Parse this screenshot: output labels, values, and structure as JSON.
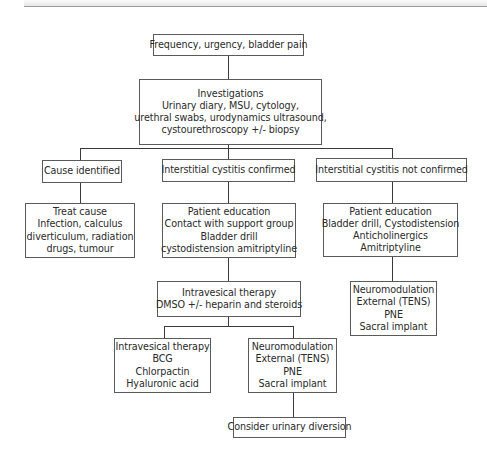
{
  "nodes": {
    "symptoms": {
      "lines": [
        "Frequency, urgency, bladder pain"
      ]
    },
    "investigations": {
      "lines": [
        "Investigations",
        "Urinary diary, MSU, cytology,",
        "urethral swabs, urodynamics ultrasound,",
        "cystourethroscopy +/- biopsy"
      ]
    },
    "cause_identified": {
      "lines": [
        "Cause identified"
      ]
    },
    "ic_confirmed": {
      "lines": [
        "Interstitial cystitis confirmed"
      ]
    },
    "ic_not_confirmed": {
      "lines": [
        "Interstitial cystitis not confirmed"
      ]
    },
    "treat_cause": {
      "lines": [
        "Treat cause",
        "Infection, calculus",
        "diverticulum, radiation",
        "drugs, tumour"
      ]
    },
    "patient_education_confirmed": {
      "lines": [
        "Patient education",
        "Contact with support group",
        "Bladder drill",
        "cystodistension amitriptyline"
      ]
    },
    "patient_education_not_confirmed": {
      "lines": [
        "Patient education",
        "Bladder drill, Cystodistension",
        "Anticholinergics",
        "Amitriptyline"
      ]
    },
    "intravesical_dmso": {
      "lines": [
        "Intravesical therapy",
        "DMSO +/- heparin and steroids"
      ]
    },
    "neuromodulation_right": {
      "lines": [
        "Neuromodulation",
        "External (TENS)",
        "PNE",
        "Sacral implant"
      ]
    },
    "intravesical_bcg": {
      "lines": [
        "Intravesical therapy",
        "BCG",
        "Chlorpactin",
        "Hyaluronic acid"
      ]
    },
    "neuromodulation_center": {
      "lines": [
        "Neuromodulation",
        "External (TENS)",
        "PNE",
        "Sacral implant"
      ]
    },
    "urinary_diversion": {
      "lines": [
        "Consider urinary diversion"
      ]
    }
  },
  "edges": [
    [
      "symptoms",
      "investigations"
    ],
    [
      "investigations",
      "cause_identified"
    ],
    [
      "investigations",
      "ic_confirmed"
    ],
    [
      "investigations",
      "ic_not_confirmed"
    ],
    [
      "cause_identified",
      "treat_cause"
    ],
    [
      "ic_confirmed",
      "patient_education_confirmed"
    ],
    [
      "ic_not_confirmed",
      "patient_education_not_confirmed"
    ],
    [
      "patient_education_confirmed",
      "intravesical_dmso"
    ],
    [
      "patient_education_not_confirmed",
      "neuromodulation_right"
    ],
    [
      "intravesical_dmso",
      "intravesical_bcg"
    ],
    [
      "intravesical_dmso",
      "neuromodulation_center"
    ],
    [
      "neuromodulation_center",
      "urinary_diversion"
    ]
  ]
}
